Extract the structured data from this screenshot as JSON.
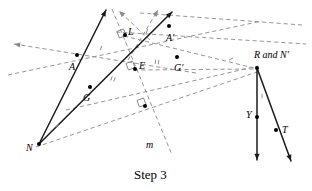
{
  "figure": {
    "caption": "Step 3",
    "caption_x": 134,
    "caption_y": 168,
    "width": 312,
    "height": 191,
    "background": "#ffffff",
    "solid_color": "#1a1a1a",
    "dashed_color": "#8a8a8a",
    "point_color": "#000000"
  },
  "labels": [
    {
      "name": "label-A",
      "text": "A",
      "x": 69,
      "y": 62,
      "italic": true
    },
    {
      "name": "label-L",
      "text": "L",
      "x": 128,
      "y": 27,
      "italic": true
    },
    {
      "name": "label-A-prime",
      "text": "A′",
      "x": 166,
      "y": 33,
      "italic": true
    },
    {
      "name": "label-E",
      "text": "E",
      "x": 139,
      "y": 61,
      "italic": true
    },
    {
      "name": "label-G-prime",
      "text": "G′",
      "x": 174,
      "y": 63,
      "italic": true
    },
    {
      "name": "label-G",
      "text": "G",
      "x": 83,
      "y": 93,
      "italic": true
    },
    {
      "name": "label-N",
      "text": "N",
      "x": 26,
      "y": 143,
      "italic": true
    },
    {
      "name": "label-m",
      "text": "m",
      "x": 146,
      "y": 140,
      "italic": true
    },
    {
      "name": "label-R-and-N-prime",
      "text": "R and N′",
      "x": 254,
      "y": 50,
      "italic": true
    },
    {
      "name": "label-Y",
      "text": "Y",
      "x": 246,
      "y": 110,
      "italic": true
    },
    {
      "name": "label-T",
      "text": "T",
      "x": 282,
      "y": 125,
      "italic": true
    }
  ],
  "points": [
    {
      "name": "point-A",
      "x": 77,
      "y": 55
    },
    {
      "name": "point-L",
      "x": 125,
      "y": 35
    },
    {
      "name": "point-A-prime",
      "x": 169,
      "y": 26
    },
    {
      "name": "point-E",
      "x": 135,
      "y": 69
    },
    {
      "name": "point-G-prime",
      "x": 177,
      "y": 57
    },
    {
      "name": "point-G",
      "x": 90,
      "y": 87
    },
    {
      "name": "point-N",
      "x": 39,
      "y": 144
    },
    {
      "name": "point-m-foot",
      "x": 145,
      "y": 106
    },
    {
      "name": "point-R-N-prime",
      "x": 257,
      "y": 68
    },
    {
      "name": "point-Y",
      "x": 257,
      "y": 117
    },
    {
      "name": "point-T",
      "x": 276,
      "y": 130
    }
  ],
  "solid_segments": [
    {
      "name": "ray-N-through-A",
      "x1": 39,
      "y1": 144,
      "x2": 106,
      "y2": 10,
      "arrow_end": true
    },
    {
      "name": "ray-N-through-G",
      "x1": 39,
      "y1": 144,
      "x2": 172,
      "y2": 12,
      "arrow_end": true
    },
    {
      "name": "segment-R-to-Y-down",
      "x1": 257,
      "y1": 68,
      "x2": 257,
      "y2": 160,
      "arrow_end": true
    },
    {
      "name": "segment-R-to-T-down",
      "x1": 257,
      "y1": 68,
      "x2": 291,
      "y2": 161,
      "arrow_end": true
    }
  ],
  "dashed_lines": [
    {
      "name": "dashed-line-through-A-leftarrow",
      "x1": 14,
      "y1": 44,
      "x2": 196,
      "y2": 73,
      "arrow_start": true
    },
    {
      "name": "dashed-line-lower-parallel",
      "x1": 8,
      "y1": 75,
      "x2": 262,
      "y2": 21,
      "arrow_start": false
    },
    {
      "name": "dashed-line-N-to-R",
      "x1": 36,
      "y1": 147,
      "x2": 260,
      "y2": 71
    },
    {
      "name": "dashed-line-G-to-Gprime-R",
      "x1": 66,
      "y1": 110,
      "x2": 258,
      "y2": 66
    },
    {
      "name": "dashed-line-top-right",
      "x1": 116,
      "y1": 32,
      "x2": 306,
      "y2": 44
    },
    {
      "name": "dashed-line-Aprime-to-R",
      "x1": 140,
      "y1": 13,
      "x2": 302,
      "y2": 25,
      "arrow_start": false
    },
    {
      "name": "dashed-line-m",
      "x1": 112,
      "y1": 9,
      "x2": 172,
      "y2": 155
    },
    {
      "name": "dashed-line-L-to-R",
      "x1": 124,
      "y1": 36,
      "x2": 258,
      "y2": 69
    },
    {
      "name": "dashed-line-E-to-R",
      "x1": 134,
      "y1": 70,
      "x2": 257,
      "y2": 69
    },
    {
      "name": "dashed-arrow-up-right-1",
      "x1": 128,
      "y1": 60,
      "x2": 158,
      "y2": 10,
      "arrow_end": true
    },
    {
      "name": "dashed-arrow-up-left",
      "x1": 150,
      "y1": 40,
      "x2": 119,
      "y2": 11,
      "arrow_end": true
    }
  ],
  "right_angle_marks": [
    {
      "name": "right-angle-at-L",
      "x": 118,
      "y": 30,
      "rot": -20
    },
    {
      "name": "right-angle-at-E",
      "x": 127,
      "y": 62,
      "rot": -20
    },
    {
      "name": "right-angle-at-m-foot",
      "x": 138,
      "y": 99,
      "rot": -20
    }
  ],
  "tick_marks": [
    {
      "name": "tick-A-to-L",
      "x": 101,
      "y": 48,
      "rot": 20
    },
    {
      "name": "tick-L-to-Aprime",
      "x": 147,
      "y": 31,
      "rot": 20
    },
    {
      "name": "tick-G-to-E",
      "x": 113,
      "y": 79,
      "rot": 20,
      "double": true
    },
    {
      "name": "tick-E-to-Gprime",
      "x": 157,
      "y": 62,
      "rot": 6,
      "double": true
    },
    {
      "name": "tick-angle-at-N",
      "x": 57,
      "y": 126,
      "rot": 62
    },
    {
      "name": "tick-angle-at-R",
      "x": 231,
      "y": 59,
      "rot": 62
    },
    {
      "name": "tick-R-to-Y",
      "x": 262,
      "y": 96,
      "rot": 0
    }
  ]
}
